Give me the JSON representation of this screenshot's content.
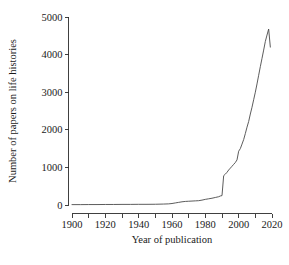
{
  "chart_data": {
    "type": "line",
    "title": "",
    "xlabel": "Year of publication",
    "ylabel": "Number of papers on life histories",
    "xlim": [
      1900,
      2020
    ],
    "ylim": [
      0,
      5000
    ],
    "xticks": [
      1900,
      1920,
      1940,
      1960,
      1980,
      2000,
      2020
    ],
    "xtick_labels": [
      "1900",
      "1920",
      "1940",
      "1960",
      "1980",
      "2000",
      "2020"
    ],
    "xminor_ticks": [
      1910,
      1930,
      1950,
      1970,
      1990,
      2010
    ],
    "yticks": [
      0,
      1000,
      2000,
      3000,
      4000,
      5000
    ],
    "ytick_labels": [
      "0",
      "1000",
      "2000",
      "3000",
      "4000",
      "5000"
    ],
    "grid": false,
    "legend": null,
    "line_color": "#4a4a4a",
    "background_color": "#ffffff",
    "series": [
      {
        "name": "Papers on life histories",
        "x": [
          1900,
          1905,
          1910,
          1915,
          1920,
          1925,
          1930,
          1935,
          1940,
          1945,
          1950,
          1955,
          1958,
          1960,
          1962,
          1964,
          1966,
          1968,
          1970,
          1972,
          1974,
          1976,
          1978,
          1980,
          1982,
          1984,
          1986,
          1988,
          1989,
          1990,
          1991,
          1992,
          1993,
          1994,
          1995,
          1996,
          1997,
          1998,
          1999,
          2000,
          2001,
          2002,
          2003,
          2004,
          2005,
          2006,
          2007,
          2008,
          2009,
          2010,
          2011,
          2012,
          2013,
          2014,
          2015,
          2016,
          2017,
          2018,
          2019
        ],
        "values": [
          10,
          10,
          12,
          12,
          14,
          14,
          16,
          16,
          18,
          18,
          20,
          25,
          30,
          40,
          55,
          70,
          85,
          95,
          100,
          105,
          110,
          115,
          130,
          150,
          165,
          180,
          200,
          220,
          240,
          250,
          780,
          820,
          870,
          930,
          980,
          1030,
          1080,
          1130,
          1200,
          1430,
          1500,
          1620,
          1740,
          1900,
          2070,
          2220,
          2420,
          2600,
          2800,
          3000,
          3220,
          3450,
          3680,
          3900,
          4120,
          4350,
          4520,
          4680,
          4200
        ]
      }
    ],
    "annotations": []
  },
  "axis": {
    "y_title": "Number of papers on life histories",
    "x_title": "Year of publication"
  }
}
